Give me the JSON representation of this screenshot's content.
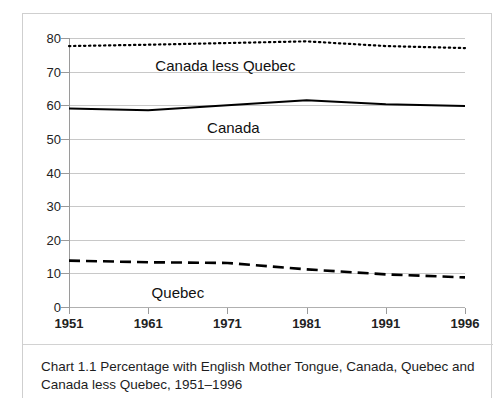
{
  "figure": {
    "caption": "Chart 1.1 Percentage with English Mother Tongue, Canada, Quebec and Canada less Quebec, 1951–1996"
  },
  "chart_data": {
    "type": "line",
    "title": "Chart 1.1 Percentage with English Mother Tongue, Canada, Quebec and Canada less Quebec, 1951–1996",
    "xlabel": "",
    "ylabel": "",
    "categories": [
      "1951",
      "1961",
      "1971",
      "1981",
      "1991",
      "1996"
    ],
    "x": [
      1951,
      1961,
      1971,
      1981,
      1991,
      1996
    ],
    "ylim": [
      0,
      80
    ],
    "ytick_step": 10,
    "yticks": [
      0,
      10,
      20,
      30,
      40,
      50,
      60,
      70,
      80
    ],
    "grid": "horizontal",
    "legend": "inline-annotations",
    "series": [
      {
        "name": "Canada less Quebec",
        "style": "dotted",
        "color": "#000000",
        "values": [
          77.6,
          78.0,
          78.5,
          79.0,
          77.6,
          77.0
        ],
        "annotation": {
          "label": "Canada less Quebec",
          "x_fraction": 0.395,
          "y_value": 72.0
        }
      },
      {
        "name": "Canada",
        "style": "solid",
        "color": "#000000",
        "values": [
          59.0,
          58.5,
          60.0,
          61.5,
          60.3,
          59.8
        ],
        "annotation": {
          "label": "Canada",
          "x_fraction": 0.415,
          "y_value": 53.5
        }
      },
      {
        "name": "Quebec",
        "style": "dashed",
        "color": "#000000",
        "values": [
          13.8,
          13.3,
          13.1,
          11.2,
          9.7,
          8.8
        ],
        "annotation": {
          "label": "Quebec",
          "x_fraction": 0.275,
          "y_value": 4.5
        }
      }
    ]
  }
}
